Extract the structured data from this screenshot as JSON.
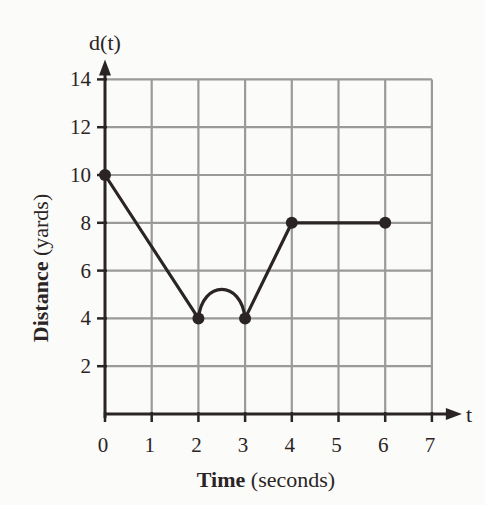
{
  "chart_data": {
    "type": "line",
    "title": "",
    "xlabel": "Time (seconds)",
    "xlabel_bold": "Time",
    "xlabel_rest": " (seconds)",
    "ylabel": "Distance (yards)",
    "ylabel_bold": "Distance",
    "ylabel_rest": " (yards)",
    "x_axis_name": "t",
    "y_axis_name": "d(t)",
    "xlim": [
      0,
      7
    ],
    "ylim": [
      0,
      14
    ],
    "x_ticks": [
      "0",
      "1",
      "2",
      "3",
      "4",
      "5",
      "6",
      "7"
    ],
    "y_ticks": [
      "2",
      "4",
      "6",
      "8",
      "10",
      "12",
      "14"
    ],
    "grid": true,
    "points": [
      {
        "x": 0,
        "y": 10
      },
      {
        "x": 2,
        "y": 4
      },
      {
        "x": 3,
        "y": 4
      },
      {
        "x": 4,
        "y": 8
      },
      {
        "x": 6,
        "y": 8
      }
    ],
    "segments": [
      {
        "from": [
          0,
          10
        ],
        "to": [
          2,
          4
        ],
        "shape": "line"
      },
      {
        "from": [
          2,
          4
        ],
        "to": [
          3,
          4
        ],
        "shape": "arc",
        "peak_y": 5.2
      },
      {
        "from": [
          3,
          4
        ],
        "to": [
          4,
          8
        ],
        "shape": "line"
      },
      {
        "from": [
          4,
          8
        ],
        "to": [
          6,
          8
        ],
        "shape": "line"
      }
    ],
    "colors": {
      "grid": "#9a9a9a",
      "line": "#2a2424",
      "background": "#fbfbf9"
    }
  }
}
